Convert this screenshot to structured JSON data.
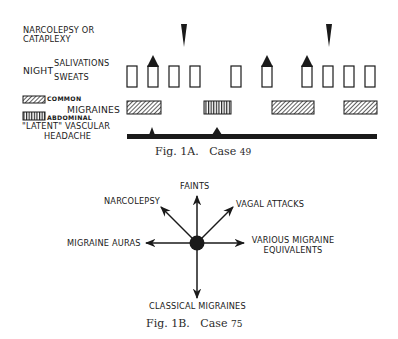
{
  "fig1a": {
    "labels": {
      "narcolepsy_line1": "NARCOLEPSY OR",
      "narcolepsy_line2": "CATAPLEXY",
      "night": "NIGHT",
      "salivations": "SALIVATIONS",
      "sweats": "SWEATS",
      "common": "COMMON",
      "migraines": "MIGRAINES",
      "abdominal": "ABDOMINAL",
      "latent_line1": "\"LATENT\" VASCULAR",
      "latent_line2": "HEADACHE"
    },
    "caption_prefix": "Fig. 1A.",
    "caption_case": "Case",
    "caption_number": "49",
    "narcolepsy_events_x": [
      184,
      329
    ],
    "night_boxes_x": [
      127,
      148,
      169,
      190,
      231,
      262,
      302,
      323,
      344,
      365
    ],
    "salivation_markers_on_boxes_x": [
      148,
      262,
      302
    ],
    "migraine_bars": [
      {
        "type": "common",
        "x_start": 127,
        "x_end": 161
      },
      {
        "type": "abdominal",
        "x_start": 204,
        "x_end": 231
      },
      {
        "type": "common",
        "x_start": 272,
        "x_end": 314
      },
      {
        "type": "common",
        "x_start": 344,
        "x_end": 377
      }
    ],
    "latent_baseline": {
      "x_start": 127,
      "x_end": 377,
      "peaks_x": [
        152,
        217
      ]
    }
  },
  "fig1b": {
    "center_label": "",
    "spokes": [
      {
        "label": "FAINTS",
        "direction": "up"
      },
      {
        "label": "NARCOLEPSY",
        "direction": "up-left"
      },
      {
        "label": "VAGAL ATTACKS",
        "direction": "up-right"
      },
      {
        "label": "MIGRAINE AURAS",
        "direction": "left"
      },
      {
        "label_line1": "VARIOUS MIGRAINE",
        "label_line2": "EQUIVALENTS",
        "direction": "right"
      },
      {
        "label": "CLASSICAL MIGRAINES",
        "direction": "down"
      }
    ],
    "caption_prefix": "Fig. 1B.",
    "caption_case": "Case",
    "caption_number": "75"
  }
}
